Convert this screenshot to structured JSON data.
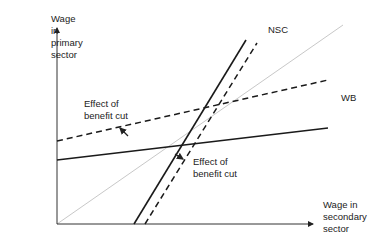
{
  "diagram": {
    "type": "economics-wage-diagram",
    "y_axis_label": "Wage\nin\nprimary\nsector",
    "x_axis_label": "Wage in\nsecondary\nsector",
    "curves": [
      {
        "name": "WB",
        "label": "WB",
        "style": "solid",
        "color": "#1a1a1a"
      },
      {
        "name": "WB-shifted",
        "label": "",
        "style": "dashed",
        "color": "#1a1a1a"
      },
      {
        "name": "NSC",
        "label": "NSC",
        "style": "solid",
        "color": "#1a1a1a"
      },
      {
        "name": "NSC-shifted",
        "label": "",
        "style": "dashed",
        "color": "#1a1a1a"
      },
      {
        "name": "45-degree-line",
        "label": "",
        "style": "solid",
        "color": "#c8c8c8"
      }
    ],
    "annotations": [
      {
        "text": "Effect of\nbenefit cut",
        "target": "WB shift upward"
      },
      {
        "text": "Effect of\nbenefit cut",
        "target": "NSC shift rightward"
      }
    ]
  }
}
